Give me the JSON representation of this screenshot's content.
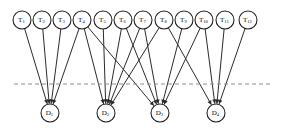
{
  "figure": {
    "type": "bipartite-assignment-diagram",
    "title": "",
    "colors": {
      "node_fill": "#ffffff",
      "node_stroke": "#1a1a1a",
      "edge": "#2b2b2b",
      "partition_line": "#8c8c8c",
      "background": "#ffffff",
      "label": "#0d0d0d"
    }
  },
  "partition": {
    "name": "partition-divider",
    "style": "dashed",
    "y": 84,
    "x_start": 14,
    "x_end": 272
  },
  "task_nodes": [
    {
      "id": "T1",
      "base": "T",
      "sub": "1",
      "cx": 22,
      "cy": 20,
      "r": 9
    },
    {
      "id": "T2",
      "base": "T",
      "sub": "2",
      "cx": 42,
      "cy": 20,
      "r": 9
    },
    {
      "id": "T3",
      "base": "T",
      "sub": "3",
      "cx": 62,
      "cy": 20,
      "r": 9
    },
    {
      "id": "T4",
      "base": "T",
      "sub": "4",
      "cx": 82,
      "cy": 20,
      "r": 9
    },
    {
      "id": "T5",
      "base": "T",
      "sub": "5",
      "cx": 103,
      "cy": 20,
      "r": 9
    },
    {
      "id": "T6",
      "base": "T",
      "sub": "6",
      "cx": 123,
      "cy": 20,
      "r": 9
    },
    {
      "id": "T7",
      "base": "T",
      "sub": "7",
      "cx": 143,
      "cy": 20,
      "r": 9
    },
    {
      "id": "T8",
      "base": "T",
      "sub": "8",
      "cx": 164,
      "cy": 20,
      "r": 9
    },
    {
      "id": "T9",
      "base": "T",
      "sub": "9",
      "cx": 184,
      "cy": 20,
      "r": 9
    },
    {
      "id": "T10",
      "base": "T",
      "sub": "10",
      "cx": 204,
      "cy": 20,
      "r": 9
    },
    {
      "id": "T11",
      "base": "T",
      "sub": "11",
      "cx": 225,
      "cy": 20,
      "r": 9
    },
    {
      "id": "T12",
      "base": "T",
      "sub": "12",
      "cx": 248,
      "cy": 20,
      "r": 9
    }
  ],
  "device_nodes": [
    {
      "id": "D1",
      "base": "D",
      "sub": "1",
      "cx": 50,
      "cy": 113,
      "r": 9
    },
    {
      "id": "D2",
      "base": "D",
      "sub": "2",
      "cx": 106,
      "cy": 113,
      "r": 9
    },
    {
      "id": "D3",
      "base": "D",
      "sub": "3",
      "cx": 160,
      "cy": 113,
      "r": 9
    },
    {
      "id": "D4",
      "base": "D",
      "sub": "4",
      "cx": 216,
      "cy": 113,
      "r": 9
    }
  ],
  "edges": [
    {
      "from": "T1",
      "to": "D1"
    },
    {
      "from": "T2",
      "to": "D1"
    },
    {
      "from": "T3",
      "to": "D1"
    },
    {
      "from": "T4",
      "to": "D1"
    },
    {
      "from": "T4",
      "to": "D2"
    },
    {
      "from": "T4",
      "to": "D3"
    },
    {
      "from": "T5",
      "to": "D2"
    },
    {
      "from": "T6",
      "to": "D2"
    },
    {
      "from": "T6",
      "to": "D3"
    },
    {
      "from": "T7",
      "to": "D2"
    },
    {
      "from": "T7",
      "to": "D3"
    },
    {
      "from": "T8",
      "to": "D2"
    },
    {
      "from": "T8",
      "to": "D4"
    },
    {
      "from": "T9",
      "to": "D3"
    },
    {
      "from": "T10",
      "to": "D3"
    },
    {
      "from": "T10",
      "to": "D4"
    },
    {
      "from": "T11",
      "to": "D4"
    },
    {
      "from": "T12",
      "to": "D4"
    }
  ],
  "counts": {
    "task_nodes": 12,
    "device_nodes": 4,
    "edges": 18
  }
}
